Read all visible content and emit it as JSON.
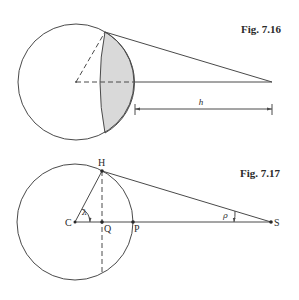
{
  "figures": [
    {
      "id": "fig-7-16",
      "caption": "Fig. 7.16",
      "dimension_label": "h",
      "shade_color": "#d9d9d9",
      "line_color": "#4a4a4a"
    },
    {
      "id": "fig-7-17",
      "caption": "Fig. 7.17",
      "points": {
        "H": "H",
        "C": "C",
        "Q": "Q",
        "P": "P",
        "S": "S"
      },
      "angles": {
        "lambda": "λ",
        "rho": "ρ"
      },
      "line_color": "#4a4a4a"
    }
  ]
}
